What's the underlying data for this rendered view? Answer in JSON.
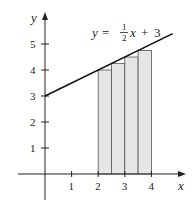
{
  "chart_data": {
    "type": "line",
    "title": "",
    "xlabel": "x",
    "ylabel": "y",
    "xlim": [
      -1,
      5.3
    ],
    "ylim": [
      -0.9,
      6.2
    ],
    "xticks": [
      1,
      2,
      3,
      4
    ],
    "yticks": [
      1,
      2,
      3,
      4,
      5
    ],
    "grid": false,
    "legend": null,
    "annotations": [
      {
        "text": "y = 1/2 x + 3",
        "position": "upper-right, above line"
      }
    ],
    "series": [
      {
        "name": "y = 1/2 x + 3",
        "kind": "line",
        "x": [
          0,
          4.8
        ],
        "y": [
          3,
          5.4
        ]
      },
      {
        "name": "left-endpoint rectangles",
        "kind": "bar",
        "width": 0.5,
        "x_left": [
          2,
          2.5,
          3,
          3.5
        ],
        "heights": [
          4,
          4.25,
          4.5,
          4.75
        ],
        "fill": "#e6e6e6",
        "stroke": "#555555"
      }
    ]
  },
  "labels": {
    "x_axis": "x",
    "y_axis": "y",
    "x_ticks": [
      "1",
      "2",
      "3",
      "4"
    ],
    "y_ticks": [
      "1",
      "2",
      "3",
      "4",
      "5"
    ],
    "equation": {
      "lhs": "y",
      "eq": "=",
      "num": "1",
      "den": "2",
      "var": "x",
      "plus": "+",
      "const": "3"
    }
  }
}
